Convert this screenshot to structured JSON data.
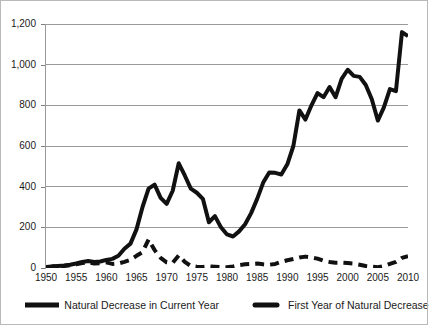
{
  "chart_data": {
    "type": "line",
    "title": "",
    "subtitle": "",
    "xlabel": "",
    "ylabel": "",
    "xlim": [
      1950,
      2010
    ],
    "ylim": [
      0,
      1200
    ],
    "yticks": [
      0,
      200,
      400,
      600,
      800,
      1000,
      1200
    ],
    "ytick_labels": [
      "0",
      "200",
      "400",
      "600",
      "800",
      "1,000",
      "1,200"
    ],
    "xticks": [
      1950,
      1955,
      1960,
      1965,
      1970,
      1975,
      1980,
      1985,
      1990,
      1995,
      2000,
      2005,
      2010
    ],
    "xtick_labels": [
      "1950",
      "1955",
      "1960",
      "1965",
      "1970",
      "1975",
      "1980",
      "1985",
      "1990",
      "1995",
      "2000",
      "2005",
      "2010"
    ],
    "grid": "horizontal",
    "legend_position": "bottom",
    "series": [
      {
        "name": "Natural Decrease in Current Year",
        "style": "solid",
        "color": "#111111",
        "width": 4,
        "x": [
          1950,
          1951,
          1952,
          1953,
          1954,
          1955,
          1956,
          1957,
          1958,
          1959,
          1960,
          1961,
          1962,
          1963,
          1964,
          1965,
          1966,
          1967,
          1968,
          1969,
          1970,
          1971,
          1972,
          1973,
          1974,
          1975,
          1976,
          1977,
          1978,
          1979,
          1980,
          1981,
          1982,
          1983,
          1984,
          1985,
          1986,
          1987,
          1988,
          1989,
          1990,
          1991,
          1992,
          1993,
          1994,
          1995,
          1996,
          1997,
          1998,
          1999,
          2000,
          2001,
          2002,
          2003,
          2004,
          2005,
          2006,
          2007,
          2008,
          2009,
          2010
        ],
        "values": [
          5,
          8,
          10,
          12,
          16,
          22,
          30,
          34,
          30,
          32,
          40,
          45,
          60,
          95,
          120,
          190,
          300,
          390,
          410,
          345,
          315,
          380,
          515,
          455,
          390,
          370,
          340,
          225,
          255,
          200,
          165,
          155,
          180,
          215,
          270,
          340,
          420,
          470,
          468,
          460,
          510,
          600,
          775,
          730,
          800,
          860,
          840,
          890,
          840,
          930,
          975,
          945,
          940,
          900,
          830,
          725,
          790,
          880,
          870,
          1160,
          1140
        ]
      },
      {
        "name": "First Year of Natural Decrease",
        "style": "dashed",
        "color": "#111111",
        "width": 4,
        "x": [
          1950,
          1951,
          1952,
          1953,
          1954,
          1955,
          1956,
          1957,
          1958,
          1959,
          1960,
          1961,
          1962,
          1963,
          1964,
          1965,
          1966,
          1967,
          1968,
          1969,
          1970,
          1971,
          1972,
          1973,
          1974,
          1975,
          1976,
          1977,
          1978,
          1979,
          1980,
          1981,
          1982,
          1983,
          1984,
          1985,
          1986,
          1987,
          1988,
          1989,
          1990,
          1991,
          1992,
          1993,
          1994,
          1995,
          1996,
          1997,
          1998,
          1999,
          2000,
          2001,
          2002,
          2003,
          2004,
          2005,
          2006,
          2007,
          2008,
          2009,
          2010
        ],
        "values": [
          4,
          6,
          8,
          10,
          14,
          18,
          24,
          28,
          22,
          24,
          28,
          20,
          22,
          30,
          40,
          60,
          78,
          140,
          88,
          50,
          28,
          26,
          62,
          30,
          10,
          6,
          5,
          8,
          6,
          4,
          4,
          8,
          14,
          18,
          20,
          22,
          18,
          16,
          20,
          30,
          38,
          44,
          52,
          56,
          52,
          46,
          36,
          30,
          26,
          26,
          24,
          22,
          16,
          10,
          6,
          4,
          10,
          20,
          30,
          50,
          58
        ]
      }
    ]
  },
  "axes": {
    "y_axis_name": "value-axis",
    "x_axis_name": "year-axis"
  },
  "legend": {
    "entries": [
      {
        "label": "Natural Decrease in Current Year",
        "style": "solid"
      },
      {
        "label": "First Year of Natural Decrease",
        "style": "dashed"
      }
    ]
  },
  "colors": {
    "series": "#111111",
    "gridline": "#9a9a9a",
    "axis": "#9a9a9a",
    "text": "#1a1a1a",
    "background": "#ffffff",
    "border": "#b9b9b9"
  }
}
